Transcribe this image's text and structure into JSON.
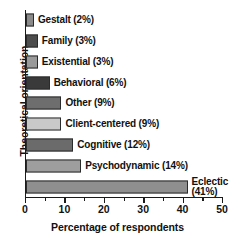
{
  "chart_data": {
    "type": "bar",
    "orientation": "horizontal",
    "title": "",
    "xlabel": "Percentage of respondents",
    "ylabel": "Theoretical orientation",
    "xlim": [
      0,
      50
    ],
    "grid": false,
    "legend": null,
    "categories": [
      "Gestalt",
      "Family",
      "Existential",
      "Behavioral",
      "Other",
      "Client-centered",
      "Cognitive",
      "Psychodynamic",
      "Eclectic"
    ],
    "values": [
      2,
      3,
      3,
      6,
      9,
      9,
      12,
      14,
      41
    ],
    "bar_labels": [
      "Gestalt (2%)",
      "Family (3%)",
      "Existential (3%)",
      "Behavioral (6%)",
      "Other (9%)",
      "Client-centered (9%)",
      "Cognitive (12%)",
      "Psychodynamic (14%)",
      "Eclectic (41%)"
    ],
    "bar_colors": [
      "#8a8a8a",
      "#4d4d4d",
      "#9a9a9a",
      "#3a3a3a",
      "#6e6e6e",
      "#c9c9c9",
      "#6b6b6b",
      "#9e9e9e",
      "#8f8f8f"
    ],
    "bar_border_color": "#2b2b2b",
    "axis_color": "#1a1a1a",
    "xticks": [
      0,
      10,
      20,
      30,
      40,
      50
    ],
    "xtick_labels": [
      "0",
      "10",
      "20",
      "30",
      "40",
      "50"
    ],
    "xticks_minor": [
      5,
      15,
      25,
      35,
      45
    ],
    "bars": [
      {
        "label": "Gestalt (2%)",
        "value": 2,
        "color": "#8a8a8a",
        "wrap": false
      },
      {
        "label": "Family (3%)",
        "value": 3,
        "color": "#4d4d4d",
        "wrap": false
      },
      {
        "label": "Existential (3%)",
        "value": 3,
        "color": "#9a9a9a",
        "wrap": false
      },
      {
        "label": "Behavioral (6%)",
        "value": 6,
        "color": "#3a3a3a",
        "wrap": false
      },
      {
        "label": "Other (9%)",
        "value": 9,
        "color": "#6e6e6e",
        "wrap": false
      },
      {
        "label": "Client-centered (9%)",
        "value": 9,
        "color": "#c9c9c9",
        "wrap": false
      },
      {
        "label": "Cognitive (12%)",
        "value": 12,
        "color": "#6b6b6b",
        "wrap": false
      },
      {
        "label": "Psychodynamic (14%)",
        "value": 14,
        "color": "#9e9e9e",
        "wrap": false
      },
      {
        "label": "Eclectic (41%)",
        "value": 41,
        "color": "#8f8f8f",
        "wrap": true
      }
    ]
  }
}
